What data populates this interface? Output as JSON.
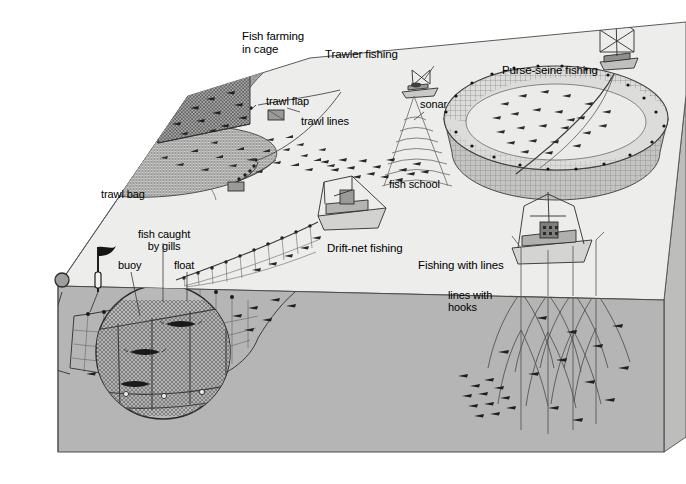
{
  "figure": {
    "kind": "technical-illustration",
    "view": "3D cutaway block showing sea surface and underwater section",
    "background_color": "#ffffff",
    "sea_surface_color": "#eeeeec",
    "underwater_color": "#b4b4b4",
    "block_side_color": "#c8c8c6",
    "line_color": "#3a3a3a",
    "net_color": "#6e6e6e",
    "fish_color": "#2b2b2b",
    "cliff_color": "#9a9a9a"
  },
  "labels": {
    "fish_farming_line1": "Fish farming",
    "fish_farming_line2": "in cage",
    "trawler_fishing": "Trawler fishing",
    "purse_seine": "Purse-seine fishing",
    "trawl_flap": "trawl flap",
    "trawl_lines": "trawl lines",
    "sonar": "sonar",
    "fish_school": "fish school",
    "trawl_bag": "trawl bag",
    "fish_caught_line1": "fish caught",
    "fish_caught_line2": "by gills",
    "buoy": "buoy",
    "float": "float",
    "drift_net": "Drift-net fishing",
    "fishing_with_lines": "Fishing with lines",
    "lines_with_hooks_line1": "lines with",
    "lines_with_hooks_line2": "hooks"
  },
  "label_positions": {
    "fish_farming": {
      "x": 242,
      "y": 36
    },
    "trawler_fishing": {
      "x": 325,
      "y": 52
    },
    "purse_seine": {
      "x": 505,
      "y": 69
    },
    "trawl_flap": {
      "x": 268,
      "y": 101
    },
    "trawl_lines": {
      "x": 303,
      "y": 121
    },
    "sonar": {
      "x": 421,
      "y": 104
    },
    "fish_school": {
      "x": 391,
      "y": 183
    },
    "trawl_bag": {
      "x": 102,
      "y": 193
    },
    "fish_caught": {
      "x": 139,
      "y": 234
    },
    "buoy": {
      "x": 120,
      "y": 265
    },
    "float": {
      "x": 176,
      "y": 265
    },
    "drift_net": {
      "x": 328,
      "y": 247
    },
    "fishing_with_lines": {
      "x": 419,
      "y": 265
    },
    "lines_with_hooks": {
      "x": 449,
      "y": 294
    }
  },
  "scene_elements": [
    {
      "name": "rocky-shoreline",
      "description": "textured grey cliff at upper left of the block top"
    },
    {
      "name": "fish-cage",
      "description": "3D mesh box cage with fish, pier walkway and standing person on top"
    },
    {
      "name": "trawl-bag",
      "description": "large funnel shaped mesh trawl net with fish inside"
    },
    {
      "name": "trawl-flap",
      "description": "small rectangular otter board on the trawl line"
    },
    {
      "name": "trawler-boat",
      "description": "trawler vessel towing trawl lines"
    },
    {
      "name": "sonar-cone",
      "description": "cone of concentric sonar arcs below the trawler"
    },
    {
      "name": "fish-school",
      "description": "dense cluster of fish detected by sonar"
    },
    {
      "name": "purse-seine-net",
      "description": "large circular bowl shaped seine net with fish enclosed"
    },
    {
      "name": "purse-seine-boat",
      "description": "seiner vessel on rim of the purse-seine net"
    },
    {
      "name": "drift-net-boat",
      "description": "drift net vessel at the sea surface"
    },
    {
      "name": "drift-net",
      "description": "long vertical gill net hanging from floats"
    },
    {
      "name": "gill-net-magnifier",
      "description": "circular magnified inset of net showing fish caught by gills"
    },
    {
      "name": "marker-flag-buoy",
      "description": "flagged marker buoy at the end of the drift net"
    },
    {
      "name": "anchor-ring",
      "description": "weighted ring anchoring the net end underwater"
    },
    {
      "name": "longline-boat",
      "description": "vessel fishing with lines"
    },
    {
      "name": "longlines",
      "description": "vertical longlines with curved branch lines and hooks"
    }
  ]
}
